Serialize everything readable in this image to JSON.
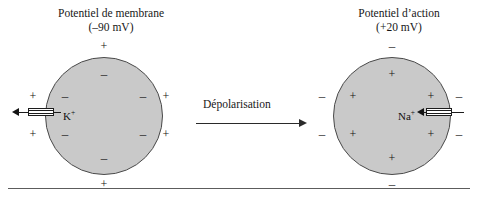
{
  "figure": {
    "panels": [
      {
        "id": "resting",
        "title_line1": "Potentiel de membrane",
        "title_line2": "(–90 mV)",
        "ion_label_text": "K",
        "ion_label_charge": "+",
        "outside_charges": [
          "+",
          "+",
          "+",
          "+",
          "+",
          "+"
        ],
        "inside_charges": [
          "–",
          "–",
          "–",
          "–",
          "–",
          "–"
        ],
        "channel_direction": "outward"
      },
      {
        "id": "action",
        "title_line1": "Potentiel d’action",
        "title_line2": "(+20 mV)",
        "ion_label_text": "Na",
        "ion_label_charge": "+",
        "outside_charges": [
          "–",
          "–",
          "–",
          "–",
          "–",
          "–"
        ],
        "inside_charges": [
          "+",
          "+",
          "+",
          "+",
          "+",
          "+"
        ],
        "channel_direction": "inward"
      }
    ],
    "transition": {
      "label": "Dépolarisation"
    },
    "colors": {
      "cell_fill": "#c9c9c9",
      "cell_stroke": "#4a4a4a",
      "text": "#171717",
      "baseline": "#5c5c5c"
    }
  }
}
